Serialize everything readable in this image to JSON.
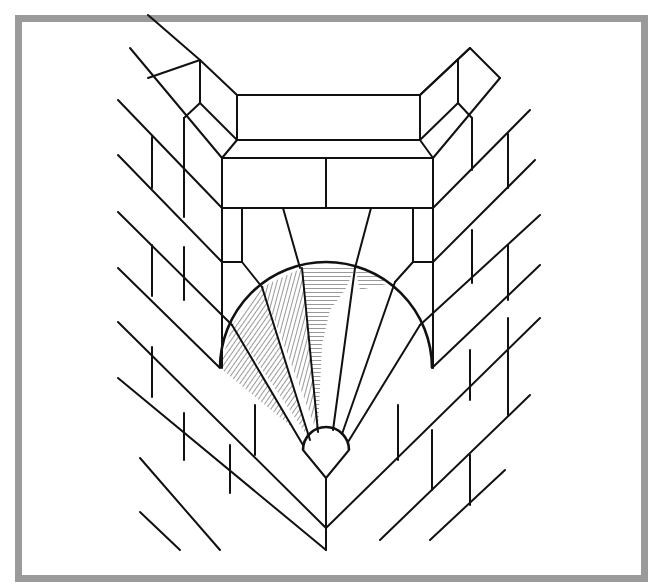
{
  "figure": {
    "frame_color": "#9a9a9a",
    "line_color": "#111111",
    "hatch_color": "#555555",
    "background": "#ffffff"
  },
  "parts": {
    "lintel": "lintel-block",
    "keystone_row": "header-bricks",
    "semi_dome": "semi-dome",
    "rays": 7,
    "hub": "half-round-hub",
    "left_wall": "left-brick-wall",
    "right_wall": "right-brick-wall",
    "corner_edge": "corner-arris"
  }
}
